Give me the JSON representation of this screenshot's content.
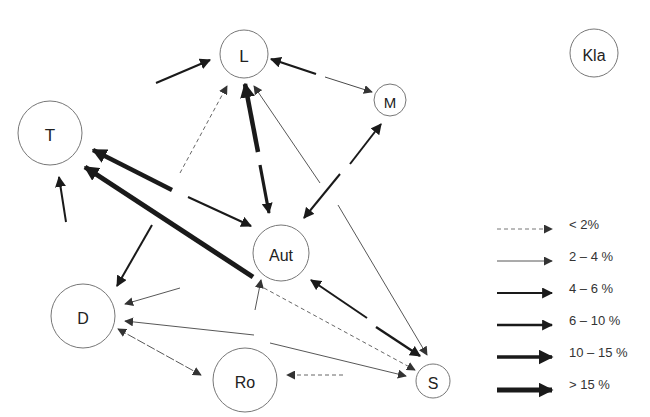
{
  "nodes": [
    {
      "id": "L",
      "label": "L",
      "x": 244,
      "y": 54,
      "r": 24,
      "size": 17
    },
    {
      "id": "M",
      "label": "M",
      "x": 390,
      "y": 100,
      "r": 16,
      "size": 15
    },
    {
      "id": "Kla",
      "label": "Kla",
      "x": 594,
      "y": 53,
      "r": 24,
      "size": 16
    },
    {
      "id": "T",
      "label": "T",
      "x": 50,
      "y": 133,
      "r": 32,
      "size": 17
    },
    {
      "id": "Aut",
      "label": "Aut",
      "x": 281,
      "y": 253,
      "r": 28,
      "size": 16
    },
    {
      "id": "D",
      "label": "D",
      "x": 83,
      "y": 316,
      "r": 32,
      "size": 16
    },
    {
      "id": "Ro",
      "label": "Ro",
      "x": 245,
      "y": 380,
      "r": 32,
      "size": 16
    },
    {
      "id": "S",
      "label": "S",
      "x": 433,
      "y": 381,
      "r": 17,
      "size": 16
    }
  ],
  "legend": [
    {
      "label": "< 2%",
      "class": "lt2"
    },
    {
      "label": "2 – 4 %",
      "class": "c2_4"
    },
    {
      "label": "4 – 6 %",
      "class": "c4_6"
    },
    {
      "label": "6 – 10 %",
      "class": "c6_10"
    },
    {
      "label": "10 – 15 %",
      "class": "c10_15"
    },
    {
      "label": "> 15 %",
      "class": "gt15"
    }
  ]
}
